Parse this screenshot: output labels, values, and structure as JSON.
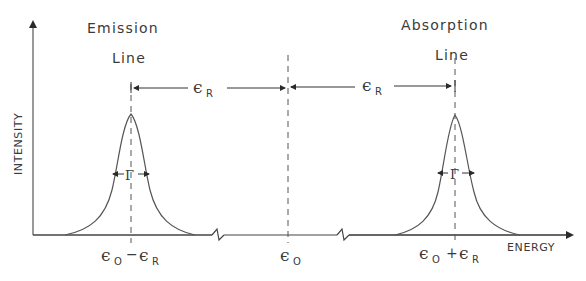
{
  "figure": {
    "labels": {
      "emission_line_1": "Emission",
      "emission_line_2": "Line",
      "absorption_line_1": "Absorption",
      "absorption_line_2": "Line",
      "y_axis": "INTENSITY",
      "x_axis": "ENERGY",
      "recoil_left_sym": "ϵ",
      "recoil_left_sub": "R",
      "recoil_right_sym": "ϵ",
      "recoil_right_sub": "R",
      "gamma_left": "Γ",
      "gamma_right": "Γ",
      "tick_left_a": "ϵ",
      "tick_left_a_sub": "O",
      "tick_left_op": "−",
      "tick_left_b": "ϵ",
      "tick_left_b_sub": "R",
      "tick_center": "ϵ",
      "tick_center_sub": "O",
      "tick_right_a": "ϵ",
      "tick_right_a_sub": "O",
      "tick_right_op": "+",
      "tick_right_b": "ϵ",
      "tick_right_b_sub": "R"
    },
    "colors": {
      "ink": "#3a3a3a",
      "background": "#ffffff"
    }
  }
}
